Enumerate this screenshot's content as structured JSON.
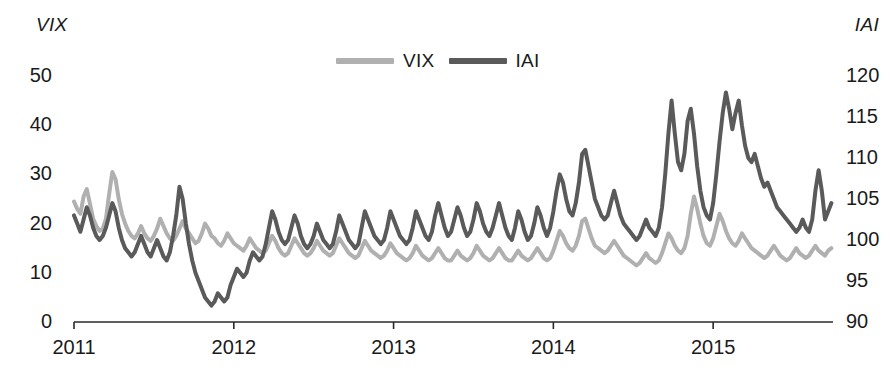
{
  "figure": {
    "background": "#ffffff",
    "left_axis_title": "VIX",
    "right_axis_title": "IAI"
  },
  "legend": {
    "position": "top-center",
    "items": [
      {
        "label": "VIX",
        "color": "#b0b0b0",
        "icon": "line-swatch-icon"
      },
      {
        "label": "IAI",
        "color": "#5a5a5a",
        "icon": "line-swatch-icon"
      }
    ]
  },
  "axes": {
    "left": {
      "title": "VIX",
      "ticks": [
        "0",
        "10",
        "20",
        "30",
        "40",
        "50"
      ],
      "range": [
        0,
        50
      ]
    },
    "right": {
      "title": "IAI",
      "ticks": [
        "90",
        "95",
        "100",
        "105",
        "110",
        "115",
        "120"
      ],
      "range": [
        90,
        120
      ]
    },
    "x": {
      "ticks": [
        "2011",
        "2012",
        "2013",
        "2014",
        "2015"
      ],
      "range": [
        2011,
        2015.75
      ]
    }
  },
  "chart_data": {
    "type": "line",
    "title": "",
    "subtitle": "",
    "xlabel": "",
    "ylabel": "VIX",
    "y2label": "IAI",
    "xlim": [
      2011,
      2015.75
    ],
    "ylim": [
      0,
      50
    ],
    "y2lim": [
      90,
      120
    ],
    "grid": false,
    "legend_position": "top-center",
    "xticks": [
      2011,
      2012,
      2013,
      2014,
      2015
    ],
    "xticklabels": [
      "2011",
      "2012",
      "2013",
      "2014",
      "2015"
    ],
    "yticks": [
      0,
      10,
      20,
      30,
      40,
      50
    ],
    "y2ticks": [
      90,
      95,
      100,
      105,
      110,
      115,
      120
    ],
    "x": [
      2011.0,
      2011.02,
      2011.04,
      2011.06,
      2011.08,
      2011.1,
      2011.12,
      2011.14,
      2011.16,
      2011.18,
      2011.2,
      2011.22,
      2011.24,
      2011.26,
      2011.28,
      2011.3,
      2011.32,
      2011.34,
      2011.36,
      2011.38,
      2011.4,
      2011.42,
      2011.44,
      2011.46,
      2011.48,
      2011.5,
      2011.52,
      2011.54,
      2011.56,
      2011.58,
      2011.6,
      2011.62,
      2011.64,
      2011.66,
      2011.68,
      2011.7,
      2011.72,
      2011.74,
      2011.76,
      2011.78,
      2011.8,
      2011.82,
      2011.84,
      2011.86,
      2011.88,
      2011.9,
      2011.92,
      2011.94,
      2011.96,
      2011.98,
      2012.0,
      2012.02,
      2012.04,
      2012.06,
      2012.08,
      2012.1,
      2012.12,
      2012.14,
      2012.16,
      2012.18,
      2012.2,
      2012.22,
      2012.24,
      2012.26,
      2012.28,
      2012.3,
      2012.32,
      2012.34,
      2012.36,
      2012.38,
      2012.4,
      2012.42,
      2012.44,
      2012.46,
      2012.48,
      2012.5,
      2012.52,
      2012.54,
      2012.56,
      2012.58,
      2012.6,
      2012.62,
      2012.64,
      2012.66,
      2012.68,
      2012.7,
      2012.72,
      2012.74,
      2012.76,
      2012.78,
      2012.8,
      2012.82,
      2012.84,
      2012.86,
      2012.88,
      2012.9,
      2012.92,
      2012.94,
      2012.96,
      2012.98,
      2013.0,
      2013.02,
      2013.04,
      2013.06,
      2013.08,
      2013.1,
      2013.12,
      2013.14,
      2013.16,
      2013.18,
      2013.2,
      2013.22,
      2013.24,
      2013.26,
      2013.28,
      2013.3,
      2013.32,
      2013.34,
      2013.36,
      2013.38,
      2013.4,
      2013.42,
      2013.44,
      2013.46,
      2013.48,
      2013.5,
      2013.52,
      2013.54,
      2013.56,
      2013.58,
      2013.6,
      2013.62,
      2013.64,
      2013.66,
      2013.68,
      2013.7,
      2013.72,
      2013.74,
      2013.76,
      2013.78,
      2013.8,
      2013.82,
      2013.84,
      2013.86,
      2013.88,
      2013.9,
      2013.92,
      2013.94,
      2013.96,
      2013.98,
      2014.0,
      2014.02,
      2014.04,
      2014.06,
      2014.08,
      2014.1,
      2014.12,
      2014.14,
      2014.16,
      2014.18,
      2014.2,
      2014.22,
      2014.24,
      2014.26,
      2014.28,
      2014.3,
      2014.32,
      2014.34,
      2014.36,
      2014.38,
      2014.4,
      2014.42,
      2014.44,
      2014.46,
      2014.48,
      2014.5,
      2014.52,
      2014.54,
      2014.56,
      2014.58,
      2014.6,
      2014.62,
      2014.64,
      2014.66,
      2014.68,
      2014.7,
      2014.72,
      2014.74,
      2014.76,
      2014.78,
      2014.8,
      2014.82,
      2014.84,
      2014.86,
      2014.88,
      2014.9,
      2014.92,
      2014.94,
      2014.96,
      2014.98,
      2015.0,
      2015.02,
      2015.04,
      2015.06,
      2015.08,
      2015.1,
      2015.12,
      2015.14,
      2015.16,
      2015.18,
      2015.2,
      2015.22,
      2015.24,
      2015.26,
      2015.28,
      2015.3,
      2015.32,
      2015.34,
      2015.36,
      2015.38,
      2015.4,
      2015.42,
      2015.44,
      2015.46,
      2015.48,
      2015.5,
      2015.52,
      2015.54,
      2015.56,
      2015.58,
      2015.6,
      2015.62,
      2015.64,
      2015.66,
      2015.68,
      2015.7,
      2015.72,
      2015.74
    ],
    "series": [
      {
        "name": "VIX",
        "color": "#b0b0b0",
        "axis": "left",
        "linewidth": 4,
        "values": [
          24.5,
          23.0,
          22.0,
          25.5,
          27.0,
          24.0,
          21.0,
          19.5,
          18.5,
          19.0,
          21.0,
          26.0,
          30.5,
          29.0,
          25.0,
          22.0,
          20.0,
          18.5,
          17.5,
          17.0,
          18.0,
          19.5,
          18.0,
          17.0,
          16.5,
          17.5,
          19.0,
          21.0,
          19.5,
          18.0,
          17.0,
          16.5,
          17.5,
          19.0,
          20.5,
          19.0,
          18.0,
          17.0,
          16.0,
          16.5,
          18.0,
          20.0,
          19.0,
          17.5,
          17.0,
          16.0,
          15.5,
          16.5,
          18.0,
          17.0,
          16.0,
          15.5,
          15.0,
          14.5,
          15.5,
          17.0,
          16.0,
          15.0,
          14.5,
          14.0,
          14.5,
          16.0,
          17.5,
          16.5,
          15.0,
          14.0,
          13.5,
          14.0,
          15.5,
          17.0,
          16.0,
          15.0,
          14.0,
          13.5,
          14.0,
          15.0,
          16.5,
          15.5,
          14.5,
          14.0,
          13.5,
          14.0,
          15.5,
          17.0,
          16.0,
          15.0,
          14.0,
          13.5,
          13.0,
          13.5,
          15.0,
          16.5,
          15.5,
          14.5,
          14.0,
          13.5,
          13.0,
          13.5,
          14.5,
          16.0,
          15.0,
          14.0,
          13.5,
          13.0,
          12.5,
          13.0,
          14.0,
          15.5,
          14.5,
          13.5,
          13.0,
          12.5,
          13.0,
          14.0,
          15.0,
          14.0,
          13.0,
          12.5,
          12.5,
          13.5,
          14.5,
          13.5,
          13.0,
          12.5,
          13.0,
          14.0,
          15.5,
          14.5,
          13.5,
          13.0,
          12.5,
          13.0,
          14.0,
          15.0,
          14.0,
          13.0,
          12.5,
          12.5,
          13.5,
          14.5,
          13.5,
          13.0,
          12.5,
          13.0,
          14.0,
          15.0,
          14.0,
          13.0,
          12.5,
          13.0,
          14.5,
          16.5,
          18.5,
          17.5,
          16.0,
          15.0,
          14.5,
          15.5,
          17.5,
          20.5,
          21.0,
          19.0,
          17.0,
          15.5,
          15.0,
          14.5,
          14.0,
          14.5,
          15.5,
          16.5,
          15.5,
          14.5,
          13.5,
          13.0,
          12.5,
          12.0,
          11.5,
          12.0,
          13.0,
          14.0,
          13.0,
          12.5,
          12.0,
          12.5,
          14.0,
          16.0,
          18.0,
          17.0,
          15.5,
          14.5,
          14.0,
          15.0,
          17.5,
          22.0,
          25.5,
          23.0,
          20.0,
          17.5,
          16.0,
          15.5,
          17.0,
          19.5,
          22.0,
          20.5,
          18.5,
          17.0,
          16.0,
          15.5,
          16.5,
          18.0,
          17.0,
          16.0,
          15.0,
          14.5,
          14.0,
          13.5,
          13.0,
          13.5,
          14.5,
          15.5,
          14.5,
          13.5,
          13.0,
          12.5,
          13.0,
          14.0,
          15.0,
          14.0,
          13.5,
          13.0,
          13.5,
          14.5,
          15.5,
          14.5,
          14.0,
          13.5,
          14.5,
          15.0
        ]
      },
      {
        "name": "IAI",
        "color": "#5a5a5a",
        "axis": "right",
        "linewidth": 4,
        "values": [
          103.0,
          102.0,
          101.0,
          102.5,
          104.0,
          103.0,
          101.5,
          100.5,
          100.0,
          100.5,
          101.5,
          103.0,
          104.5,
          103.5,
          101.5,
          100.0,
          99.0,
          98.5,
          98.0,
          98.5,
          99.5,
          100.5,
          99.5,
          98.5,
          98.0,
          99.0,
          100.0,
          99.0,
          98.0,
          97.5,
          98.5,
          100.5,
          103.0,
          106.5,
          105.0,
          102.0,
          99.5,
          97.5,
          96.0,
          95.0,
          94.0,
          93.0,
          92.5,
          92.0,
          92.5,
          93.5,
          93.0,
          92.5,
          93.0,
          94.5,
          95.5,
          96.5,
          96.0,
          95.5,
          96.0,
          97.5,
          98.5,
          98.0,
          97.5,
          98.0,
          99.5,
          101.5,
          103.5,
          102.5,
          101.0,
          100.0,
          99.5,
          100.0,
          101.5,
          103.0,
          102.0,
          100.5,
          99.5,
          99.0,
          99.5,
          100.5,
          102.0,
          101.0,
          100.0,
          99.5,
          99.0,
          99.5,
          101.0,
          103.0,
          102.0,
          101.0,
          100.0,
          99.5,
          99.0,
          99.5,
          101.5,
          103.5,
          102.5,
          101.5,
          100.5,
          100.0,
          99.5,
          100.0,
          101.5,
          103.5,
          102.5,
          101.5,
          100.5,
          100.0,
          99.5,
          100.0,
          101.5,
          103.5,
          102.5,
          101.5,
          100.5,
          100.0,
          101.0,
          103.0,
          104.5,
          103.0,
          101.5,
          100.5,
          101.0,
          102.5,
          104.0,
          103.0,
          101.5,
          100.5,
          101.0,
          102.5,
          104.5,
          103.5,
          102.0,
          101.0,
          100.5,
          101.5,
          103.0,
          104.5,
          103.0,
          101.5,
          100.5,
          100.0,
          101.5,
          103.5,
          102.5,
          101.0,
          100.0,
          100.5,
          102.0,
          104.0,
          103.0,
          101.5,
          100.5,
          101.5,
          103.5,
          106.0,
          108.0,
          107.0,
          105.0,
          103.5,
          103.0,
          104.5,
          107.0,
          110.5,
          111.0,
          109.0,
          107.0,
          105.0,
          104.0,
          103.0,
          102.5,
          103.0,
          104.5,
          106.0,
          104.5,
          103.0,
          102.0,
          101.5,
          101.0,
          100.5,
          100.0,
          100.5,
          101.5,
          102.5,
          101.5,
          101.0,
          100.5,
          101.5,
          104.0,
          108.0,
          113.0,
          117.0,
          113.0,
          109.5,
          108.5,
          110.5,
          114.5,
          116.0,
          113.0,
          109.0,
          106.0,
          104.0,
          103.0,
          102.5,
          104.5,
          108.0,
          112.0,
          115.5,
          118.0,
          116.0,
          113.5,
          115.5,
          117.0,
          114.0,
          111.5,
          110.0,
          109.5,
          110.5,
          109.0,
          107.5,
          106.5,
          107.0,
          106.0,
          105.0,
          104.0,
          103.5,
          103.0,
          102.5,
          102.0,
          101.5,
          101.0,
          101.5,
          102.5,
          101.5,
          101.0,
          102.5,
          106.0,
          108.5,
          106.0,
          102.5,
          103.5,
          104.5
        ]
      }
    ]
  }
}
